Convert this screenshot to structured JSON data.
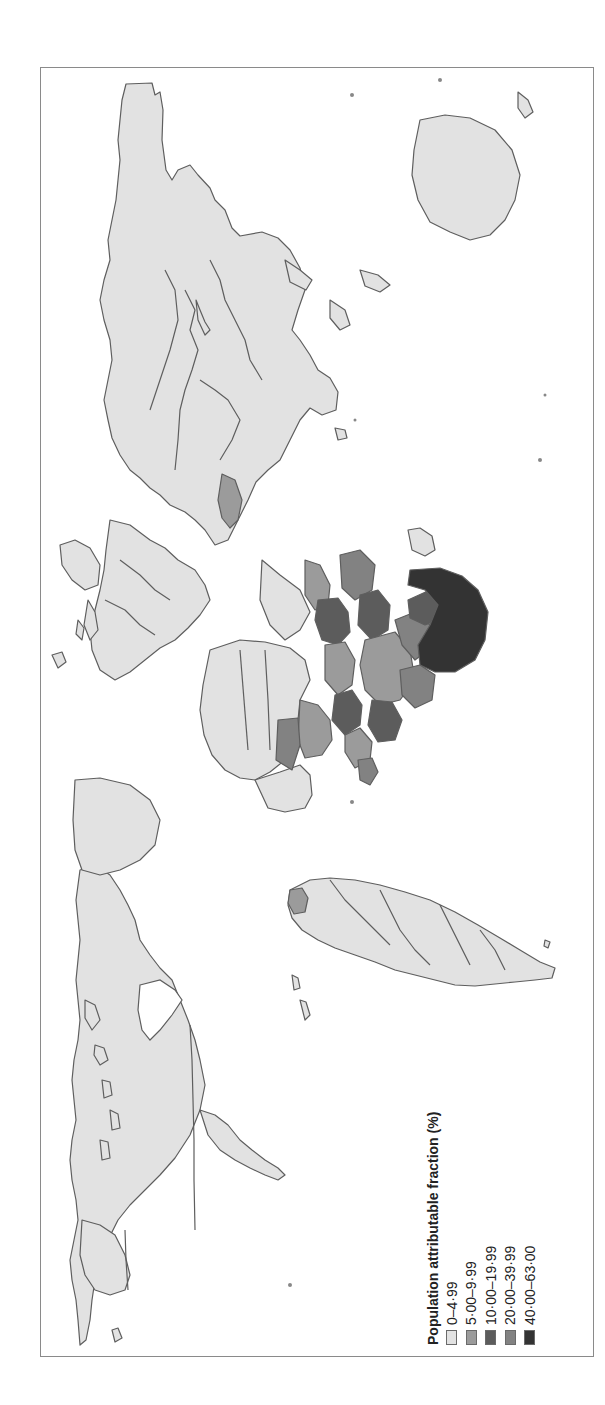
{
  "figure": {
    "orientation": "rotated 90 degrees clockwise (north points left)",
    "type": "world choropleth map"
  },
  "legend": {
    "title": "Population attributable fraction (%)",
    "items": [
      {
        "label": "0–4·99",
        "color": "#e2e2e2"
      },
      {
        "label": "5·00–9·99",
        "color": "#9b9b9b"
      },
      {
        "label": "10·00–19·99",
        "color": "#5c5c5c"
      },
      {
        "label": "20·00–39·99",
        "color": "#828282"
      },
      {
        "label": "40·00–63·00",
        "color": "#333333"
      }
    ]
  },
  "colors": {
    "land_default": "#e2e2e2",
    "border": "#5e5e5e",
    "frame": "#8a8a8a",
    "water": "#ffffff"
  },
  "highlighted_regions": [
    {
      "region": "Southern Africa (Lesotho/Swaziland/South Africa/Botswana area)",
      "class": "40·00–63·00"
    },
    {
      "region": "Eastern and Southern Africa (Mozambique, Zimbabwe, Zambia, Malawi, Tanzania, Kenya, Uganda)",
      "class": "10·00–39·99"
    },
    {
      "region": "Central/West Africa (selected countries)",
      "class": "5·00–19·99"
    },
    {
      "region": "Namibia / Angola region",
      "class": "20·00–39·99"
    },
    {
      "region": "Myanmar / Thailand region",
      "class": "5·00–9·99"
    },
    {
      "region": "Guyana / Suriname region",
      "class": "5·00–9·99"
    }
  ]
}
